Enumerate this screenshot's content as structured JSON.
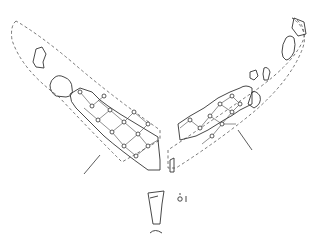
{
  "figure": {
    "panels": [
      {
        "name": "left-fragment",
        "description": "fragment with diamond-mesh knotted net pattern"
      },
      {
        "name": "right-fragment",
        "description": "fragment with diamond-mesh knotted net pattern"
      },
      {
        "name": "cross-section",
        "description": "profile section"
      }
    ],
    "labels": [],
    "colors": {
      "line": "#333333",
      "background": "#ffffff"
    }
  }
}
